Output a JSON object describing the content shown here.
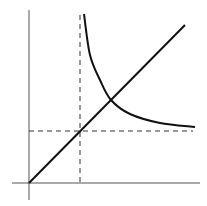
{
  "chart_data": {
    "type": "line",
    "title": "",
    "xlabel": "",
    "ylabel": "",
    "grid": false,
    "legend": null,
    "tick_labels": {
      "x": [],
      "y": []
    },
    "series": [
      {
        "name": "increasing-line",
        "kind": "straight line through origin",
        "points_px": [
          [
            29,
            183
          ],
          [
            185,
            25
          ]
        ]
      },
      {
        "name": "decreasing-curve",
        "kind": "hyperbola-like decreasing curve",
        "points_px": [
          [
            84,
            14
          ],
          [
            90,
            55
          ],
          [
            100,
            80
          ],
          [
            111,
            100
          ],
          [
            130,
            114
          ],
          [
            160,
            123
          ],
          [
            195,
            127
          ]
        ]
      }
    ],
    "reference_lines": [
      {
        "name": "vertical-dashed",
        "orientation": "vertical",
        "x_px": 80,
        "from_px": 15,
        "to_px": 183
      },
      {
        "name": "horizontal-dashed",
        "orientation": "horizontal",
        "y_px": 131,
        "from_px": 29,
        "to_px": 193
      }
    ],
    "intersections_px": {
      "line_curve": [
        111,
        100
      ],
      "line_dashed": [
        80,
        131
      ]
    },
    "axes_px": {
      "origin": [
        29,
        183
      ],
      "x_axis": {
        "from": 12,
        "to": 200
      },
      "y_axis": {
        "from": 10,
        "to": 200
      }
    }
  }
}
